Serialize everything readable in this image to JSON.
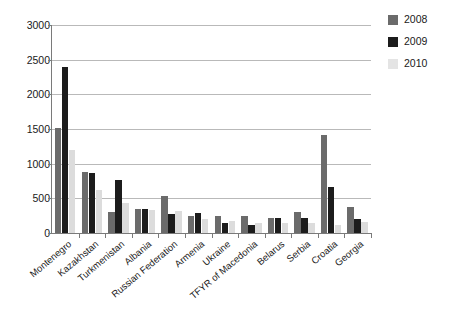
{
  "chart_data": {
    "type": "bar",
    "title": "",
    "subtitle": "",
    "xlabel": "",
    "ylabel": "",
    "ylim": [
      0,
      3000
    ],
    "ytick_step": 500,
    "yticks": [
      "0",
      "500",
      "1000",
      "1500",
      "2000",
      "2500",
      "3000"
    ],
    "grid": true,
    "legend_position": "top-right",
    "categories": [
      "Montenegro",
      "Kazakhstan",
      "Turkmenistan",
      "Albania",
      "Russian Federation",
      "Armenia",
      "Ukraine",
      "TFYR of Macedonia",
      "Belarus",
      "Serbia",
      "Croatia",
      "Georgia"
    ],
    "series": [
      {
        "name": "2008",
        "color": "#6b6b6b",
        "values": [
          1520,
          880,
          310,
          350,
          530,
          250,
          250,
          250,
          210,
          300,
          1410,
          370
        ]
      },
      {
        "name": "2009",
        "color": "#1c1c1c",
        "values": [
          2400,
          860,
          760,
          340,
          280,
          290,
          150,
          110,
          215,
          220,
          660,
          200
        ]
      },
      {
        "name": "2010",
        "color": "#dcdcdc",
        "values": [
          1200,
          620,
          430,
          330,
          320,
          195,
          170,
          140,
          150,
          140,
          110,
          155
        ]
      }
    ]
  }
}
